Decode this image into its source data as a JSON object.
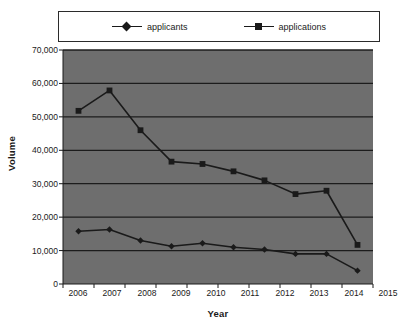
{
  "chart_data": {
    "type": "line",
    "title": "",
    "xlabel": "Year",
    "ylabel": "Volume",
    "categories": [
      "2006",
      "2007",
      "2008",
      "2009",
      "2010",
      "2011",
      "2012",
      "2013",
      "2014",
      "2015"
    ],
    "series": [
      {
        "name": "applicants",
        "marker": "diamond",
        "color": "#1a1a1a",
        "values": [
          15800,
          16300,
          13000,
          11300,
          12200,
          11000,
          10300,
          9000,
          9000,
          4000
        ]
      },
      {
        "name": "applications",
        "marker": "square",
        "color": "#1a1a1a",
        "values": [
          51800,
          57900,
          46000,
          36600,
          35900,
          33700,
          31000,
          26900,
          27900,
          11700
        ]
      }
    ],
    "ylim": [
      0,
      70000
    ],
    "yticks": [
      0,
      10000,
      20000,
      30000,
      40000,
      50000,
      60000,
      70000
    ],
    "ytick_labels": [
      "0",
      "10,000",
      "20,000",
      "30,000",
      "40,000",
      "50,000",
      "60,000",
      "70,000"
    ],
    "grid": true,
    "grid_axis": "y",
    "legend_position": "top-inside",
    "plot_background": "#6e6e6e",
    "gridline_color": "#1c1c1c",
    "canvas_background": "#ffffff"
  },
  "legend": {
    "entries": [
      {
        "label": "applicants"
      },
      {
        "label": "applications"
      }
    ]
  },
  "axes": {
    "y_title": "Volume",
    "x_title": "Year"
  }
}
